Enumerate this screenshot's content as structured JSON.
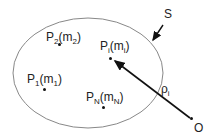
{
  "diagram": {
    "surface_label": "S",
    "origin_label": "O",
    "vector_label": {
      "base": "ρ",
      "sub": "i"
    },
    "points": [
      {
        "id": "P2",
        "base": "P",
        "sub": "2",
        "mass_base": "m",
        "mass_sub": "2"
      },
      {
        "id": "Pi",
        "base": "P",
        "sub": "i",
        "mass_base": "m",
        "mass_sub": "i"
      },
      {
        "id": "P1",
        "base": "P",
        "sub": "1",
        "mass_base": "m",
        "mass_sub": "1"
      },
      {
        "id": "PN",
        "base": "P",
        "sub": "N",
        "mass_base": "m",
        "mass_sub": "N"
      }
    ],
    "colors": {
      "ellipse": "#888888",
      "arrow": "#111111",
      "text": "#222222"
    }
  }
}
